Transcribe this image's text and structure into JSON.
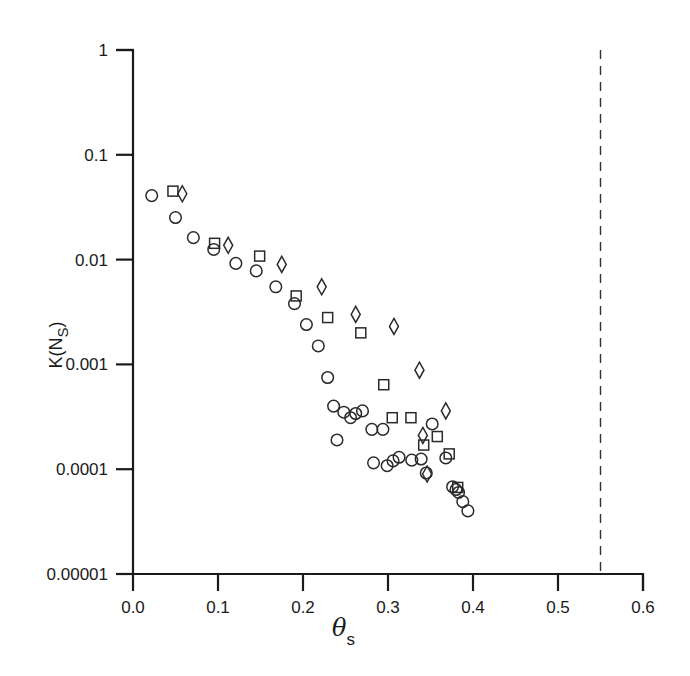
{
  "chart_data": {
    "type": "scatter",
    "title": "",
    "xlabel": "θ_s",
    "xlabel_main": "θ",
    "xlabel_sub": "s",
    "ylabel": "K(N_S)",
    "ylabel_main": "K(N",
    "ylabel_sub": "S",
    "ylabel_close": ")",
    "xlim": [
      0.0,
      0.6
    ],
    "ylim": [
      1e-05,
      1
    ],
    "yscale": "log",
    "grid": false,
    "legend": null,
    "x_ticks": [
      "0.0",
      "0.1",
      "0.2",
      "0.3",
      "0.4",
      "0.5",
      "0.6"
    ],
    "x_tick_values": [
      0.0,
      0.1,
      0.2,
      0.3,
      0.4,
      0.5,
      0.6
    ],
    "y_ticks": [
      "1",
      "0.1",
      "0.01",
      "0.001",
      "0.0001",
      "0.00001"
    ],
    "y_tick_values": [
      1,
      0.1,
      0.01,
      0.001,
      0.0001,
      1e-05
    ],
    "annotations": [
      {
        "type": "vertical-dashed-line",
        "x": 0.55
      }
    ],
    "series": [
      {
        "name": "circles",
        "marker": "circle",
        "points": [
          [
            0.022,
            0.0408
          ],
          [
            0.05,
            0.0252
          ],
          [
            0.071,
            0.0162
          ],
          [
            0.095,
            0.0125
          ],
          [
            0.121,
            0.0092
          ],
          [
            0.145,
            0.0078
          ],
          [
            0.168,
            0.0055
          ],
          [
            0.19,
            0.0038
          ],
          [
            0.204,
            0.0024
          ],
          [
            0.218,
            0.0015
          ],
          [
            0.229,
            0.00075
          ],
          [
            0.236,
            0.0004
          ],
          [
            0.24,
            0.00019
          ],
          [
            0.248,
            0.00035
          ],
          [
            0.256,
            0.00031
          ],
          [
            0.262,
            0.00034
          ],
          [
            0.27,
            0.00036
          ],
          [
            0.281,
            0.00024
          ],
          [
            0.283,
            0.000115
          ],
          [
            0.294,
            0.00024
          ],
          [
            0.299,
            0.000108
          ],
          [
            0.306,
            0.00012
          ],
          [
            0.313,
            0.00013
          ],
          [
            0.328,
            0.000122
          ],
          [
            0.339,
            0.000125
          ],
          [
            0.345,
            9.2e-05
          ],
          [
            0.352,
            0.00027
          ],
          [
            0.368,
            0.000128
          ],
          [
            0.376,
            6.8e-05
          ],
          [
            0.38,
            6.4e-05
          ],
          [
            0.383,
            6e-05
          ],
          [
            0.388,
            4.9e-05
          ],
          [
            0.394,
            4e-05
          ]
        ]
      },
      {
        "name": "squares",
        "marker": "square",
        "points": [
          [
            0.047,
            0.045
          ],
          [
            0.096,
            0.0143
          ],
          [
            0.149,
            0.0108
          ],
          [
            0.192,
            0.0045
          ],
          [
            0.229,
            0.0028
          ],
          [
            0.268,
            0.002
          ],
          [
            0.295,
            0.00064
          ],
          [
            0.305,
            0.00031
          ],
          [
            0.327,
            0.00031
          ],
          [
            0.342,
            0.00017
          ],
          [
            0.358,
            0.000205
          ],
          [
            0.372,
            0.00014
          ],
          [
            0.382,
            6.7e-05
          ]
        ]
      },
      {
        "name": "diamonds",
        "marker": "diamond",
        "points": [
          [
            0.058,
            0.0425
          ],
          [
            0.112,
            0.0137
          ],
          [
            0.175,
            0.009
          ],
          [
            0.222,
            0.0055
          ],
          [
            0.262,
            0.003
          ],
          [
            0.307,
            0.0023
          ],
          [
            0.337,
            0.00088
          ],
          [
            0.368,
            0.00036
          ],
          [
            0.341,
            0.00021
          ],
          [
            0.346,
            9e-05
          ]
        ]
      }
    ]
  }
}
